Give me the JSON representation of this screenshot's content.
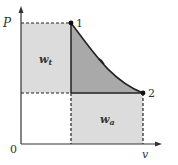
{
  "diagram": {
    "axes": {
      "y_label": "P",
      "x_label": "v",
      "origin_label": "0"
    },
    "points": [
      {
        "label": "1",
        "x": 71,
        "y": 23
      },
      {
        "label": "2",
        "x": 143,
        "y": 93
      }
    ],
    "regions": {
      "technical_work": {
        "label_main": "w",
        "label_sub": "t",
        "color": "#d9d9d9"
      },
      "expansion_work": {
        "label_main": "w",
        "label_sub": "a",
        "color": "#d9d9d9"
      },
      "overlap": {
        "color": "#a6a6a6"
      }
    },
    "colors": {
      "line": "#222222",
      "light_fill": "#d9d9d9",
      "dark_fill": "#a8a8a8"
    }
  }
}
